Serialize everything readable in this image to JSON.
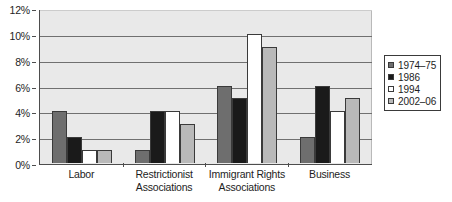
{
  "chart_data": {
    "type": "bar",
    "title": "",
    "subtitle": "",
    "xlabel": "",
    "ylabel": "",
    "ylim": [
      0,
      12
    ],
    "ytick_values": [
      0,
      2,
      4,
      6,
      8,
      10,
      12
    ],
    "ytick_labels": [
      "0%",
      "2%",
      "4%",
      "6%",
      "8%",
      "10%",
      "12%"
    ],
    "grid": true,
    "legend_position": "right",
    "value_suffix": "%",
    "categories": [
      "Labor",
      "Restrictionist Associations",
      "Immigrant Rights Associations",
      "Business"
    ],
    "category_lines": [
      [
        "Labor"
      ],
      [
        "Restrictionist",
        "Associations"
      ],
      [
        "Immigrant Rights",
        "Associations"
      ],
      [
        "Business"
      ]
    ],
    "series": [
      {
        "name": "1974–75",
        "color": "#6e6e6e",
        "values": [
          4,
          1,
          6,
          2
        ]
      },
      {
        "name": "1986",
        "color": "#1a1a1a",
        "values": [
          2,
          4,
          5,
          6
        ]
      },
      {
        "name": "1994",
        "color": "#ffffff",
        "values": [
          1,
          4,
          10,
          4
        ]
      },
      {
        "name": "2002–06",
        "color": "#b9b9b9",
        "values": [
          1,
          3,
          9,
          5
        ]
      }
    ]
  },
  "legend": {
    "items": [
      {
        "label": "1974–75"
      },
      {
        "label": "1986"
      },
      {
        "label": "1994"
      },
      {
        "label": "2002–06"
      }
    ]
  },
  "colors": {
    "plot_background": "#e9e9e9",
    "gridline": "#707070",
    "axis": "#4d4d4d",
    "text": "#1d1d1d",
    "page_background": "#ffffff"
  }
}
